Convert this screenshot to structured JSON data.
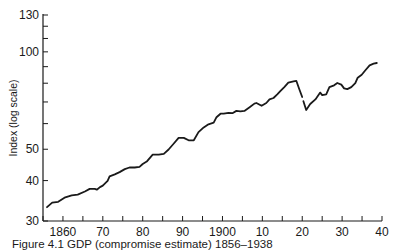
{
  "chart_data": {
    "type": "line",
    "title": "",
    "caption": "Figure 4.1 GDP (compromise estimate) 1856–1938",
    "xlabel": "",
    "ylabel": "Index (log scale)",
    "yscale": "log",
    "xlim": [
      1855,
      1940
    ],
    "ylim": [
      30,
      130
    ],
    "grid": false,
    "legend": null,
    "x_ticks": [
      1855,
      1860,
      1865,
      1870,
      1875,
      1880,
      1885,
      1890,
      1895,
      1900,
      1905,
      1910,
      1915,
      1920,
      1925,
      1930,
      1935,
      1940
    ],
    "x_tick_labels": [
      {
        "value": 1860,
        "label": "1860"
      },
      {
        "value": 1870,
        "label": "70"
      },
      {
        "value": 1880,
        "label": "80"
      },
      {
        "value": 1890,
        "label": "90"
      },
      {
        "value": 1900,
        "label": "1900"
      },
      {
        "value": 1910,
        "label": "10"
      },
      {
        "value": 1920,
        "label": "20"
      },
      {
        "value": 1930,
        "label": "30"
      },
      {
        "value": 1940,
        "label": "40"
      }
    ],
    "y_ticks": [
      30,
      40,
      50,
      60,
      70,
      80,
      90,
      100,
      110,
      120,
      130
    ],
    "y_tick_labels": [
      {
        "value": 30,
        "label": "30"
      },
      {
        "value": 40,
        "label": "40"
      },
      {
        "value": 50,
        "label": "50"
      },
      {
        "value": 100,
        "label": "100"
      },
      {
        "value": 130,
        "label": "130"
      }
    ],
    "series": [
      {
        "name": "GDP index",
        "segments": [
          {
            "x": [
              1856.0,
              1857.3,
              1858.8,
              1860.4,
              1862.2,
              1863.7,
              1865.5,
              1866.7,
              1868.0,
              1868.5,
              1869.3,
              1870.0,
              1871.2,
              1871.7,
              1873.0,
              1874.2,
              1875.5,
              1876.7,
              1878.0,
              1879.2,
              1880.0,
              1881.0,
              1882.5,
              1884.0,
              1885.3,
              1886.5,
              1887.8,
              1889.0,
              1890.3,
              1891.5,
              1892.8,
              1894.0,
              1895.3,
              1896.5,
              1897.8,
              1898.5,
              1899.5,
              1900.3,
              1901.5,
              1902.5,
              1903.5,
              1904.5,
              1905.5,
              1906.8,
              1908.0,
              1908.5,
              1909.8,
              1911.0,
              1911.8,
              1912.8,
              1913.8,
              1914.5,
              1915.5,
              1916.5,
              1917.8,
              1918.5,
              1919.3,
              1920.0
            ],
            "y": [
              33.1,
              34.2,
              34.4,
              35.4,
              36.0,
              36.2,
              37.0,
              37.7,
              37.7,
              37.5,
              38.2,
              38.6,
              39.9,
              41.2,
              41.8,
              42.5,
              43.4,
              43.9,
              43.9,
              44.1,
              45.0,
              45.8,
              48.1,
              48.1,
              48.4,
              49.9,
              52.1,
              54.2,
              54.2,
              53.3,
              53.3,
              56.5,
              58.4,
              59.7,
              60.4,
              62.8,
              64.4,
              64.4,
              64.8,
              64.6,
              65.7,
              65.5,
              65.7,
              67.4,
              69.2,
              69.5,
              68.1,
              69.5,
              71.3,
              72.0,
              74.0,
              75.6,
              77.8,
              80.3,
              81.1,
              81.4,
              76.5,
              72.5
            ]
          },
          {
            "x": [
              1920.3,
              1921.0,
              1922.0,
              1923.3,
              1924.5,
              1925.0,
              1926.0,
              1926.8,
              1928.0,
              1928.8,
              1929.8,
              1930.5,
              1931.3,
              1932.3,
              1933.3,
              1933.9,
              1934.9,
              1935.9,
              1936.9,
              1937.9,
              1938.7
            ],
            "y": [
              70.4,
              66.1,
              69.0,
              71.3,
              74.8,
              73.5,
              73.9,
              77.8,
              78.8,
              80.1,
              79.2,
              77.1,
              76.7,
              77.8,
              80.0,
              83.2,
              85.0,
              87.9,
              90.9,
              91.9,
              92.4
            ]
          }
        ]
      }
    ]
  }
}
